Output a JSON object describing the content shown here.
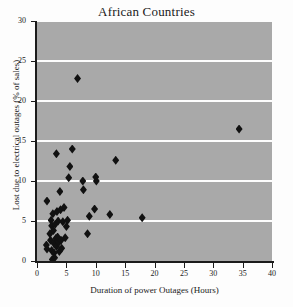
{
  "chart_data": {
    "type": "scatter",
    "title": "African Countries",
    "xlabel": "Duration of power Outages (Hours)",
    "ylabel": "Lost due to electrical outages (% of sales)",
    "xlim": [
      0,
      40
    ],
    "ylim": [
      0,
      30
    ],
    "xticks": [
      0,
      5,
      10,
      15,
      20,
      25,
      30,
      35,
      40
    ],
    "yticks": [
      0,
      5,
      10,
      15,
      20,
      25,
      30
    ],
    "grid": "horizontal",
    "legend": "none",
    "marker": "diamond",
    "marker_color": "#111111",
    "plot_background": "#a9a9a9",
    "gridline_color": "#fdfdfd",
    "points": [
      {
        "x": 1.7,
        "y": 7.5
      },
      {
        "x": 1.6,
        "y": 2.0
      },
      {
        "x": 1.7,
        "y": 1.5
      },
      {
        "x": 2.2,
        "y": 3.4
      },
      {
        "x": 2.3,
        "y": 2.6
      },
      {
        "x": 2.4,
        "y": 5.1
      },
      {
        "x": 2.5,
        "y": 4.4
      },
      {
        "x": 2.5,
        "y": 1.3
      },
      {
        "x": 2.6,
        "y": 0.2
      },
      {
        "x": 2.7,
        "y": 5.9
      },
      {
        "x": 2.8,
        "y": 3.8
      },
      {
        "x": 2.9,
        "y": 2.2
      },
      {
        "x": 2.9,
        "y": 1.0
      },
      {
        "x": 3.0,
        "y": 0.4
      },
      {
        "x": 3.1,
        "y": 4.6
      },
      {
        "x": 3.2,
        "y": 2.8
      },
      {
        "x": 3.3,
        "y": 13.4
      },
      {
        "x": 3.3,
        "y": 1.8
      },
      {
        "x": 3.4,
        "y": 6.2
      },
      {
        "x": 3.5,
        "y": 3.0
      },
      {
        "x": 3.6,
        "y": 5.0
      },
      {
        "x": 3.7,
        "y": 2.3
      },
      {
        "x": 3.8,
        "y": 1.2
      },
      {
        "x": 3.9,
        "y": 8.7
      },
      {
        "x": 4.0,
        "y": 6.4
      },
      {
        "x": 4.1,
        "y": 2.6
      },
      {
        "x": 4.2,
        "y": 1.6
      },
      {
        "x": 4.4,
        "y": 4.9
      },
      {
        "x": 4.6,
        "y": 6.7
      },
      {
        "x": 4.8,
        "y": 2.9
      },
      {
        "x": 5.0,
        "y": 4.3
      },
      {
        "x": 5.2,
        "y": 5.1
      },
      {
        "x": 5.4,
        "y": 10.4
      },
      {
        "x": 5.6,
        "y": 11.8
      },
      {
        "x": 6.0,
        "y": 14.0
      },
      {
        "x": 6.9,
        "y": 22.8
      },
      {
        "x": 7.8,
        "y": 10.0
      },
      {
        "x": 7.9,
        "y": 8.9
      },
      {
        "x": 8.6,
        "y": 3.4
      },
      {
        "x": 8.9,
        "y": 5.6
      },
      {
        "x": 9.8,
        "y": 6.5
      },
      {
        "x": 10.0,
        "y": 10.5
      },
      {
        "x": 10.1,
        "y": 10.0
      },
      {
        "x": 12.4,
        "y": 5.8
      },
      {
        "x": 13.4,
        "y": 12.6
      },
      {
        "x": 17.9,
        "y": 5.4
      },
      {
        "x": 34.4,
        "y": 16.5
      }
    ]
  }
}
